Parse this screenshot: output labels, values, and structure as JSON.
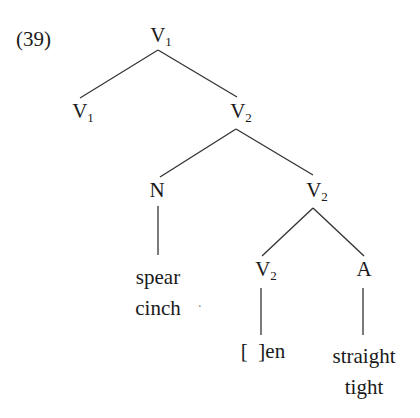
{
  "example_number": "(39)",
  "nodes": {
    "root": {
      "cat": "V",
      "sub": "1"
    },
    "left_child": {
      "cat": "V",
      "sub": "1"
    },
    "right_child": {
      "cat": "V",
      "sub": "2"
    },
    "noun": {
      "cat": "N",
      "sub": ""
    },
    "verb_mid": {
      "cat": "V",
      "sub": "2"
    },
    "verb_low": {
      "cat": "V",
      "sub": "2"
    },
    "adj": {
      "cat": "A",
      "sub": ""
    }
  },
  "leaves": {
    "noun_words": [
      "spear",
      "cinch"
    ],
    "verb_word": "[  ]en",
    "adj_words": [
      "straight",
      "tight"
    ],
    "stray_mark": "."
  },
  "colors": {
    "ink": "#1a1a1a",
    "line": "#333333",
    "background": "#ffffff"
  }
}
